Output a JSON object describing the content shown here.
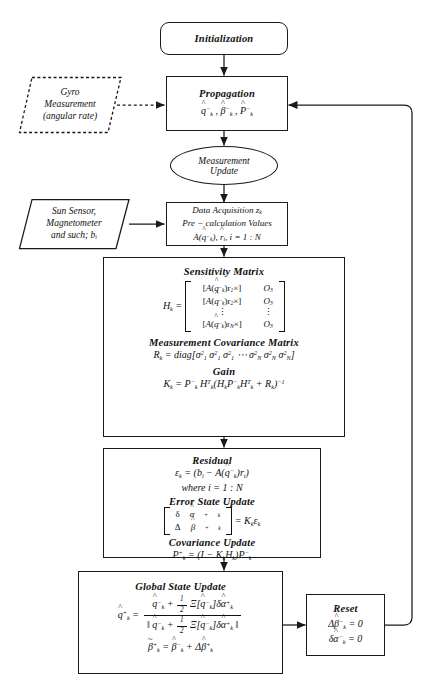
{
  "diagram": {
    "nodes": {
      "initialization": {
        "label": "Initialization"
      },
      "gyro": {
        "line1": "Gyro",
        "line2": "Measurement",
        "line3": "(angular rate)"
      },
      "propagation": {
        "title": "Propagation",
        "state": "q̂⁻ₖ , β̂⁻ₖ , P̂⁻ₖ"
      },
      "measurement_update": {
        "line1": "Measurement",
        "line2": "Update"
      },
      "sensors": {
        "line1": "Sun Sensor,",
        "line2": "Magnetometer",
        "line3": "and such; bᵢ"
      },
      "data_acquisition": {
        "line1": "Data Acquisition zₖ",
        "line2": "Pre − calculation Values",
        "line3": "A(q̂⁻ₖ), r̂ᵢ, i = 1 : N"
      },
      "sensitivity": {
        "title": "Sensitivity Matrix",
        "lhs": "Hₖ =",
        "matrix_rows": [
          {
            "col1": "[A(q̂⁻ₖ)r₁×]",
            "col2": "O₃"
          },
          {
            "col1": "[A(q̂⁻ₖ)r₂×]",
            "col2": "O₃"
          },
          {
            "col1": "⋮",
            "col2": "⋮"
          },
          {
            "col1": "[A(q̂⁻ₖ)r_N×]",
            "col2": "O₃"
          }
        ],
        "cov_title": "Measurement Covariance Matrix",
        "cov_eq": "Rₖ = diag[σ²₁ σ²₁ σ²₁ ⋯ σ²_N σ²_N σ²_N]",
        "gain_title": "Gain",
        "gain_eq": "Kₖ = P⁻ₖ Hᵀₖ(HₖP⁻ₖHᵀₖ + Rₖ)⁻¹"
      },
      "residual": {
        "title": "Residual",
        "eq": "ϵₖ = (bᵢ − A(q̂⁻ₖ)rᵢ)",
        "where": "where i = 1 : N",
        "error_title": "Error State Update",
        "error_eq_lhs_top": "δα̂⁺ₖ",
        "error_eq_lhs_bot": "Δβ̂⁺ₖ",
        "error_eq_rhs": "= Kₖϵₖ",
        "cov_title": "Covariance Update",
        "cov_eq": "P⁺ₖ = (I − KₖHₖ)P⁻ₖ"
      },
      "global_state": {
        "title": "Global State Update",
        "q_lhs": "q̂⁺ₖ =",
        "q_num": "q̂⁻ₖ + ½Ξ[q̂⁻ₖ]δα̂⁺ₖ",
        "q_den": "‖ q̂⁻ₖ + ½Ξ[q̂⁻ₖ]δα̂⁺ₖ ‖",
        "beta_eq": "β̃⁺ₖ = β̂⁻ₖ + Δβ̂⁺ₖ"
      },
      "reset": {
        "title": "Reset",
        "eq1": "Δβ̂⁻ₖ = 0",
        "eq2": "δα̂⁻ₖ = 0"
      }
    },
    "colors": {
      "stroke": "#1a1a1a",
      "background": "#ffffff"
    }
  }
}
